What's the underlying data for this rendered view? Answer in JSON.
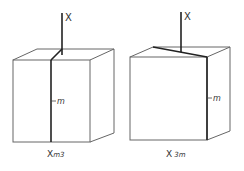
{
  "figures": [
    {
      "id": "left",
      "axis_label": "X",
      "plane_label": "m",
      "caption_main": "X",
      "caption_sub": "m3"
    },
    {
      "id": "right",
      "axis_label": "X",
      "plane_label": "m",
      "caption_main": "X",
      "caption_sub": "3m"
    }
  ],
  "colors": {
    "stroke": "#555555",
    "thick": "#2a2a2a",
    "text": "#333333"
  }
}
